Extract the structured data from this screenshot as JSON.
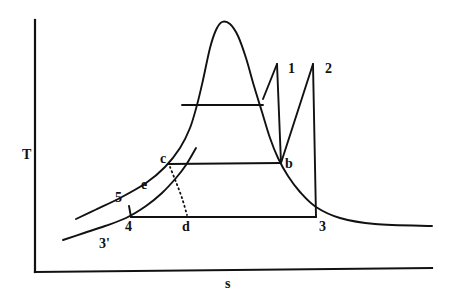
{
  "figure": {
    "background_color": "#ffffff",
    "line_color": "#111111"
  },
  "axes": {
    "y_label": "T",
    "x_label": "s",
    "y_axis": {
      "x": 35,
      "y_top": 20,
      "y_bottom": 272
    },
    "x_axis": {
      "y": 272,
      "x_left": 35,
      "x_right": 432
    }
  },
  "labels": {
    "p1": "1",
    "p2": "2",
    "p3": "3",
    "p3prime": "3'",
    "p4": "4",
    "p5": "5",
    "pb": "b",
    "pc": "c",
    "pd": "d",
    "pe": "e"
  },
  "chart_data": {
    "type": "line",
    "xlabel": "s",
    "ylabel": "T",
    "grid": false,
    "legend": null,
    "note": "Pixel coordinates in a 449x302 canvas; y increases downward.",
    "state_points": [
      {
        "name": "1",
        "x": 277,
        "y": 64,
        "label_x": 288,
        "label_y": 62
      },
      {
        "name": "2",
        "x": 313,
        "y": 64,
        "label_x": 325,
        "label_y": 62
      },
      {
        "name": "3",
        "x": 316,
        "y": 217,
        "label_x": 319,
        "label_y": 220
      },
      {
        "name": "3'",
        "x": 95,
        "y": 236,
        "label_x": 99,
        "label_y": 237
      },
      {
        "name": "4",
        "x": 131,
        "y": 217,
        "label_x": 125,
        "label_y": 220
      },
      {
        "name": "5",
        "x": 129,
        "y": 207,
        "label_x": 115,
        "label_y": 191
      },
      {
        "name": "b",
        "x": 281,
        "y": 163,
        "label_x": 285,
        "label_y": 157
      },
      {
        "name": "c",
        "x": 168,
        "y": 164,
        "label_x": 160,
        "label_y": 152
      },
      {
        "name": "d",
        "x": 187,
        "y": 217,
        "label_x": 182,
        "label_y": 220
      },
      {
        "name": "e",
        "x": 151,
        "y": 183,
        "label_x": 141,
        "label_y": 178
      }
    ],
    "curves": [
      {
        "name": "saturation-dome",
        "style": "solid",
        "points": [
          [
            76,
            219
          ],
          [
            95,
            210
          ],
          [
            120,
            198
          ],
          [
            146,
            183
          ],
          [
            165,
            167
          ],
          [
            180,
            148
          ],
          [
            190,
            128
          ],
          [
            197,
            105
          ],
          [
            203,
            80
          ],
          [
            210,
            48
          ],
          [
            216,
            30
          ],
          [
            222,
            22
          ],
          [
            230,
            24
          ],
          [
            238,
            36
          ],
          [
            246,
            58
          ],
          [
            254,
            86
          ],
          [
            262,
            112
          ],
          [
            270,
            138
          ],
          [
            278,
            158
          ],
          [
            288,
            176
          ],
          [
            300,
            192
          ],
          [
            316,
            207
          ],
          [
            340,
            218
          ],
          [
            375,
            224
          ],
          [
            432,
            226
          ]
        ]
      },
      {
        "name": "lower-isobar-left-tail",
        "style": "solid",
        "points": [
          [
            63,
            240
          ],
          [
            84,
            233
          ],
          [
            105,
            226
          ],
          [
            126,
            218
          ],
          [
            146,
            206
          ],
          [
            162,
            193
          ],
          [
            176,
            178
          ],
          [
            186,
            165
          ],
          [
            196,
            148
          ]
        ]
      },
      {
        "name": "line-1-to-dome",
        "style": "solid",
        "points": [
          [
            277,
            64
          ],
          [
            263,
            99
          ]
        ]
      },
      {
        "name": "line-1-to-b",
        "style": "solid",
        "points": [
          [
            277,
            64
          ],
          [
            281,
            163
          ]
        ]
      },
      {
        "name": "line-b-to-2",
        "style": "solid",
        "points": [
          [
            281,
            163
          ],
          [
            313,
            64
          ]
        ]
      },
      {
        "name": "line-2-to-3",
        "style": "solid",
        "points": [
          [
            313,
            64
          ],
          [
            316,
            217
          ]
        ]
      },
      {
        "name": "upper-isobar-horizontal",
        "style": "solid",
        "points": [
          [
            182,
            105
          ],
          [
            263,
            105
          ]
        ]
      },
      {
        "name": "isobar-c-to-b",
        "style": "solid",
        "points": [
          [
            168,
            164
          ],
          [
            281,
            163
          ]
        ]
      },
      {
        "name": "isobar-4-to-3",
        "style": "solid",
        "points": [
          [
            131,
            217
          ],
          [
            316,
            217
          ]
        ]
      },
      {
        "name": "line-5-to-4",
        "style": "solid",
        "points": [
          [
            129,
            206
          ],
          [
            131,
            217
          ]
        ]
      },
      {
        "name": "dotted-c-to-d",
        "style": "dotted",
        "points": [
          [
            170,
            167
          ],
          [
            176,
            182
          ],
          [
            182,
            198
          ],
          [
            187,
            215
          ]
        ]
      }
    ]
  }
}
